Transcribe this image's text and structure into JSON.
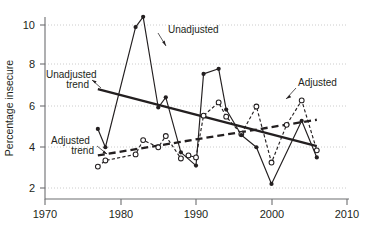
{
  "chart_data": {
    "type": "line",
    "title": "",
    "subtitle": "",
    "xlabel": "",
    "ylabel": "Percentage insecure",
    "xlim": [
      1970,
      2010
    ],
    "ylim": [
      1.45,
      10.85
    ],
    "xticks": [
      1970,
      1980,
      1990,
      2000,
      2010
    ],
    "xtick_labels": [
      "1970",
      "1980",
      "1990",
      "2000",
      "2010"
    ],
    "yticks": [
      2,
      4,
      6,
      8,
      10
    ],
    "ytick_labels": [
      "2",
      "4",
      "6",
      "8",
      "10"
    ],
    "grid": "horizontal-dotted",
    "legend_position": "inline-annotations",
    "series": [
      {
        "name": "Unadjusted",
        "marker": "filled-circle",
        "linestyle": "solid",
        "x": [
          1977,
          1978,
          1982,
          1983,
          1985,
          1986,
          1988,
          1990,
          1991,
          1993,
          1994,
          1996,
          1998,
          2000,
          2004,
          2006
        ],
        "values": [
          4.9,
          4.0,
          9.9,
          10.4,
          5.95,
          6.45,
          3.75,
          3.1,
          7.6,
          7.85,
          5.85,
          4.6,
          4.0,
          2.2,
          5.3,
          3.5
        ]
      },
      {
        "name": "Adjusted",
        "marker": "open-circle",
        "linestyle": "dashed",
        "x": [
          1977,
          1978,
          1982,
          1983,
          1985,
          1986,
          1988,
          1989,
          1990,
          1991,
          1993,
          1994,
          1996,
          1998,
          2000,
          2002,
          2004,
          2006
        ],
        "values": [
          3.05,
          3.35,
          3.65,
          4.35,
          4.0,
          4.55,
          3.45,
          3.6,
          3.5,
          5.55,
          6.2,
          5.5,
          4.65,
          6.0,
          3.25,
          5.1,
          6.3,
          3.85
        ]
      },
      {
        "name": "Unadjusted trend",
        "marker": "none",
        "linestyle": "solid-thick",
        "x": [
          1977,
          2006
        ],
        "values": [
          6.85,
          4.05
        ]
      },
      {
        "name": "Adjusted trend",
        "marker": "none",
        "linestyle": "dashed-thick",
        "x": [
          1977,
          2006
        ],
        "values": [
          3.6,
          5.35
        ]
      }
    ],
    "annotations": [
      {
        "label": "Unadjusted",
        "label_x": 1990.1,
        "label_y": 9.25
      },
      {
        "label": "Unadjusted\ntrend",
        "line1": "Unadjusted",
        "line2": "trend",
        "label_x": 1972.2,
        "label_y": 7.45
      },
      {
        "label": "Adjusted\ntrend",
        "line1": "Adjusted",
        "line2": "trend",
        "label_x": 1973.0,
        "label_y": 4.35
      },
      {
        "label": "Adjusted",
        "label_x": 2001.7,
        "label_y": 6.95
      }
    ],
    "colors": {
      "ink": "#231f20",
      "axis": "#6d6e71",
      "grid": "#bfbfbf",
      "background": "#ffffff"
    }
  },
  "axis": {
    "y_title": "Percentage insecure",
    "x_tick_0": "1970",
    "x_tick_1": "1980",
    "x_tick_2": "1990",
    "x_tick_3": "2000",
    "x_tick_4": "2010",
    "y_tick_0": "2",
    "y_tick_1": "4",
    "y_tick_2": "6",
    "y_tick_3": "8",
    "y_tick_4": "10"
  },
  "labels": {
    "unadjusted": "Unadjusted",
    "unadjusted_trend_l1": "Unadjusted",
    "unadjusted_trend_l2": "trend",
    "adjusted_trend_l1": "Adjusted",
    "adjusted_trend_l2": "trend",
    "adjusted": "Adjusted"
  }
}
